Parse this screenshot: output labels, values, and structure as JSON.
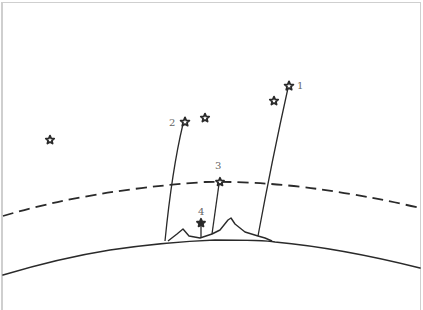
{
  "diagram": {
    "title": "",
    "labels": [
      {
        "id": "1",
        "text": "1"
      },
      {
        "id": "2",
        "text": "2"
      },
      {
        "id": "3",
        "text": "3"
      },
      {
        "id": "4",
        "text": "4"
      }
    ],
    "elements": {
      "earth_surface": "solid curved line",
      "atmosphere_boundary": "dashed curved line",
      "mountains": "two peaks on surface",
      "stars": [
        {
          "name": "star-1",
          "label": "1",
          "connected": true
        },
        {
          "name": "star-1-companion",
          "label": "",
          "connected": false
        },
        {
          "name": "star-2",
          "label": "2",
          "connected": true
        },
        {
          "name": "star-2-companion",
          "label": "",
          "connected": false
        },
        {
          "name": "star-3",
          "label": "3",
          "connected": true
        },
        {
          "name": "star-4",
          "label": "4",
          "connected": true
        },
        {
          "name": "star-isolated-left",
          "label": "",
          "connected": false
        }
      ]
    },
    "colors": {
      "ink": "#2a2a2a",
      "label": "#666666",
      "background": "#ffffff",
      "frame": "#cfcfcf"
    }
  }
}
